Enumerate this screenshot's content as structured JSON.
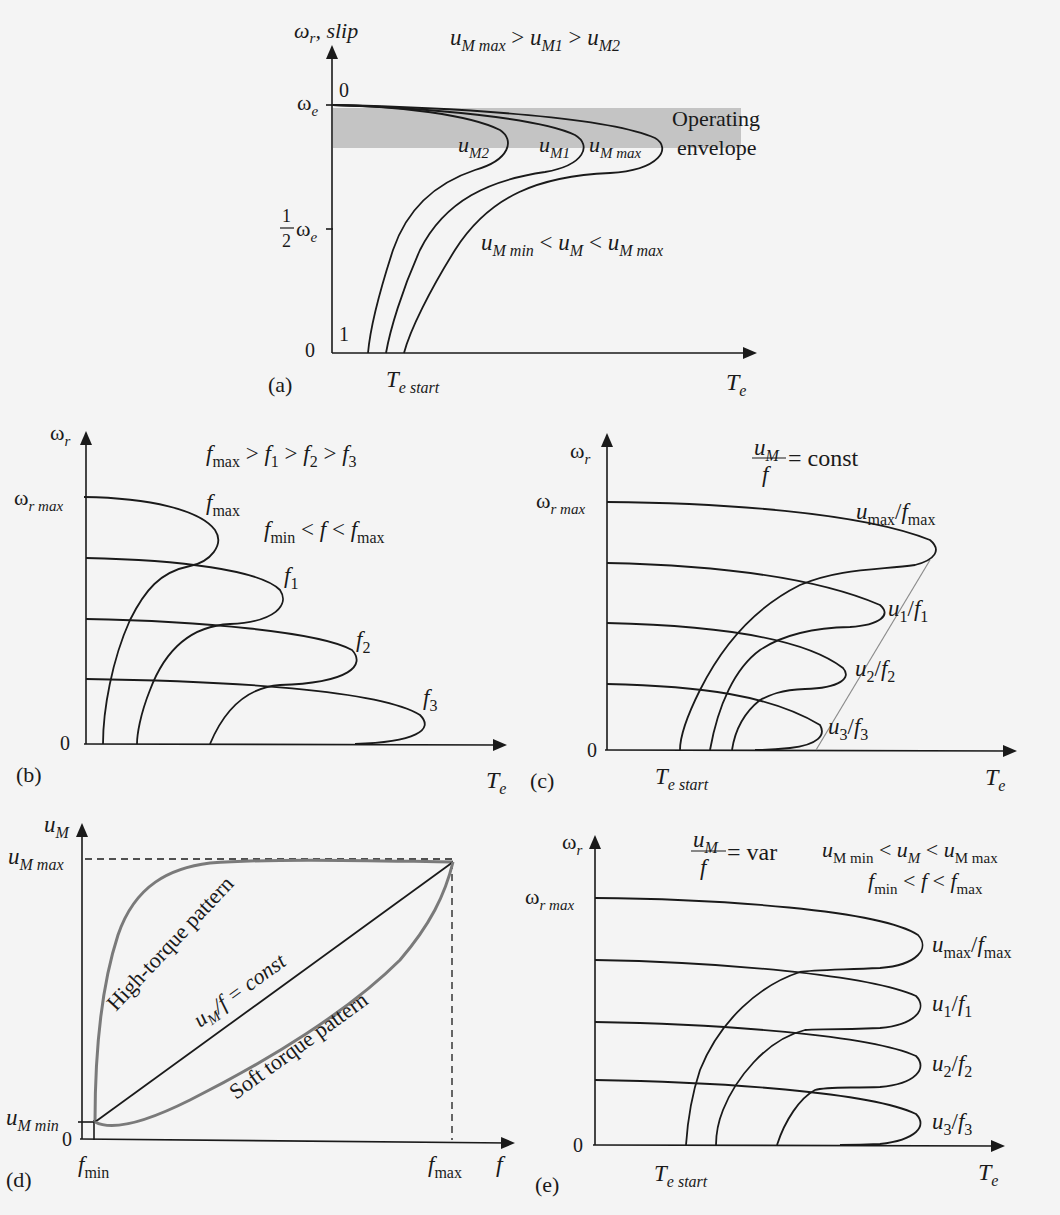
{
  "figure": {
    "background": "#f4f4f4",
    "envelope_color": "#c4c4c4",
    "panels": {
      "a": {
        "tag": "(a)",
        "y_axis_label": "ω",
        "y_axis_sub": "r",
        "y_axis_suffix": ", slip",
        "relation_top": "u_M max > u_M1 > u_M2",
        "rel_u1": "u",
        "rel_s1": "M max",
        "rel_gt1": " > ",
        "rel_u2": "u",
        "rel_s2": "M1",
        "rel_gt2": " > ",
        "rel_u3": "u",
        "rel_s3": "M2",
        "slip_zero": "0",
        "slip_one": "1",
        "tick_we": "ω",
        "tick_we_sub": "e",
        "tick_half_num": "1",
        "tick_half_den": "2",
        "origin": "0",
        "envelope_line1": "Operating",
        "envelope_line2": "envelope",
        "curve_labels": [
          {
            "base": "u",
            "sub": "M2"
          },
          {
            "base": "u",
            "sub": "M1"
          },
          {
            "base": "u",
            "sub": "M max"
          }
        ],
        "range_u": "u",
        "range_s1": "M min",
        "range_lt1": " < ",
        "range_u2": "u",
        "range_s2": "M",
        "range_lt2": " < ",
        "range_u3": "u",
        "range_s3": "M max",
        "x_start": "T",
        "x_start_sub": "e start",
        "x_axis": "T",
        "x_axis_sub": "e"
      },
      "b": {
        "tag": "(b)",
        "y_axis": "ω",
        "y_axis_sub": "r",
        "tick_max": "ω",
        "tick_max_sub": "r max",
        "origin": "0",
        "rel": [
          {
            "base": "f",
            "sub": "max"
          },
          {
            "op": " > "
          },
          {
            "base": "f",
            "sub": "1"
          },
          {
            "op": " > "
          },
          {
            "base": "f",
            "sub": "2"
          },
          {
            "op": " > "
          },
          {
            "base": "f",
            "sub": "3"
          }
        ],
        "range_f1": "f",
        "range_s1": "min",
        "range_op1": " < ",
        "range_f": "f",
        "range_op2": " < ",
        "range_f2": "f",
        "range_s2": "max",
        "curve_labels": [
          {
            "base": "f",
            "sub": "max"
          },
          {
            "base": "f",
            "sub": "1"
          },
          {
            "base": "f",
            "sub": "2"
          },
          {
            "base": "f",
            "sub": "3"
          }
        ],
        "x_axis": "T",
        "x_axis_sub": "e"
      },
      "c": {
        "tag": "(c)",
        "y_axis": "ω",
        "y_axis_sub": "r",
        "tick_max": "ω",
        "tick_max_sub": "r max",
        "origin": "0",
        "frac_num": "u",
        "frac_num_sub": "M",
        "frac_den": "f",
        "frac_rhs": "= const",
        "curve_labels": [
          {
            "u": "u",
            "us": "max",
            "f": "f",
            "fs": "max"
          },
          {
            "u": "u",
            "us": "1",
            "f": "f",
            "fs": "1"
          },
          {
            "u": "u",
            "us": "2",
            "f": "f",
            "fs": "2"
          },
          {
            "u": "u",
            "us": "3",
            "f": "f",
            "fs": "3"
          }
        ],
        "x_start": "T",
        "x_start_sub": "e start",
        "x_axis": "T",
        "x_axis_sub": "e"
      },
      "d": {
        "tag": "(d)",
        "y_axis": "u",
        "y_axis_sub": "M",
        "tick_max": "u",
        "tick_max_sub": "M max",
        "tick_min": "u",
        "tick_min_sub": "M min",
        "origin": "0",
        "x_fmin": "f",
        "x_fmin_sub": "min",
        "x_fmax": "f",
        "x_fmax_sub": "max",
        "x_axis": "f",
        "label_high": "High-torque pattern",
        "label_const_u": "u",
        "label_const_sub": "M",
        "label_const_rest": "/f = const",
        "label_soft": "Soft torque pattern"
      },
      "e": {
        "tag": "(e)",
        "y_axis": "ω",
        "y_axis_sub": "r",
        "tick_max": "ω",
        "tick_max_sub": "r max",
        "origin": "0",
        "frac_num": "u",
        "frac_num_sub": "M",
        "frac_den": "f",
        "frac_rhs": "= var",
        "range1_u": "u",
        "range1_s1": "M min",
        "range1_op": " < ",
        "range1_u2": "u",
        "range1_s2": "M",
        "range1_u3": "u",
        "range1_s3": "M max",
        "range2_f": "f",
        "range2_s1": "min",
        "range2_op": " < ",
        "range2_f2": "f",
        "range2_f3": "f",
        "range2_s3": "max",
        "curve_labels": [
          {
            "u": "u",
            "us": "max",
            "f": "f",
            "fs": "max"
          },
          {
            "u": "u",
            "us": "1",
            "f": "f",
            "fs": "1"
          },
          {
            "u": "u",
            "us": "2",
            "f": "f",
            "fs": "2"
          },
          {
            "u": "u",
            "us": "3",
            "f": "f",
            "fs": "3"
          }
        ],
        "x_start": "T",
        "x_start_sub": "e start",
        "x_axis": "T",
        "x_axis_sub": "e"
      }
    }
  }
}
